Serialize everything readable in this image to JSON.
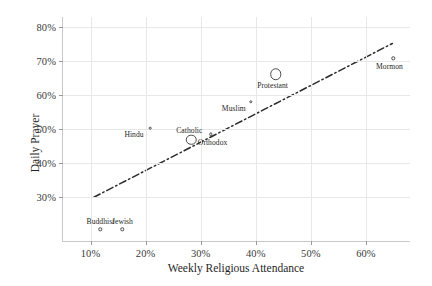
{
  "chart_data": {
    "type": "scatter",
    "title": "",
    "xlabel": "Weekly Religious Attendance",
    "ylabel": "Daily Prayer",
    "xlim": [
      5,
      68
    ],
    "ylim": [
      17,
      83
    ],
    "xticks": [
      "10%",
      "20%",
      "30%",
      "40%",
      "50%",
      "60%"
    ],
    "xtick_values": [
      10,
      20,
      30,
      40,
      50,
      60
    ],
    "yticks": [
      "30%",
      "40%",
      "50%",
      "60%",
      "70%",
      "80%"
    ],
    "ytick_values": [
      30,
      40,
      50,
      60,
      70,
      80
    ],
    "grid": true,
    "legend": "none",
    "points": [
      {
        "label": "Buddhist",
        "x": 11.8,
        "y": 20.5,
        "size": 3.4,
        "label_dx": 0,
        "label_dy": -12
      },
      {
        "label": "Jewish",
        "x": 15.8,
        "y": 20.5,
        "size": 3.4,
        "label_dx": 0,
        "label_dy": -12
      },
      {
        "label": "Hindu",
        "x": 20.8,
        "y": 50.3,
        "size": 2.6,
        "label_dx": -16,
        "label_dy": 2
      },
      {
        "label": "Catholic",
        "x": 28.3,
        "y": 46.8,
        "size": 10.5,
        "label_dx": -2,
        "label_dy": -14
      },
      {
        "label": "Orthodox",
        "x": 31.8,
        "y": 48.4,
        "size": 3.4,
        "label_dx": 2,
        "label_dy": 4
      },
      {
        "label": "Muslim",
        "x": 39.1,
        "y": 58.1,
        "size": 3.4,
        "label_dx": -17,
        "label_dy": 2
      },
      {
        "label": "Protestant",
        "x": 43.6,
        "y": 66.2,
        "size": 11.5,
        "label_dx": -3,
        "label_dy": 7
      },
      {
        "label": "Mormon",
        "x": 65.0,
        "y": 70.8,
        "size": 3.4,
        "label_dx": -4,
        "label_dy": 4
      }
    ],
    "trendline": {
      "style": "dash-dot",
      "color": "#2b2b2b",
      "x_start": 10.6,
      "y_start": 29.9,
      "x_end": 64.8,
      "y_end": 75.2
    }
  },
  "axis": {
    "y_title": "Daily Prayer",
    "x_title": "Weekly Religious Attendance"
  }
}
